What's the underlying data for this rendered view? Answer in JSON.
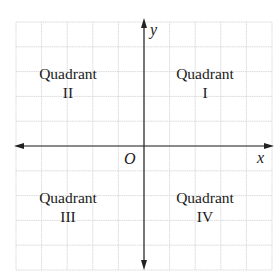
{
  "diagram": {
    "type": "coordinate-plane",
    "grid": {
      "columns": 10,
      "rows": 10
    },
    "axes": {
      "x_label": "x",
      "y_label": "y",
      "origin_label": "O"
    },
    "quadrants": [
      {
        "id": "I",
        "line1": "Quadrant",
        "line2": "I"
      },
      {
        "id": "II",
        "line1": "Quadrant",
        "line2": "II"
      },
      {
        "id": "III",
        "line1": "Quadrant",
        "line2": "III"
      },
      {
        "id": "IV",
        "line1": "Quadrant",
        "line2": "IV"
      }
    ],
    "colors": {
      "grid": "#cfcfcf",
      "axis": "#222222",
      "text": "#1a1a1a"
    }
  }
}
